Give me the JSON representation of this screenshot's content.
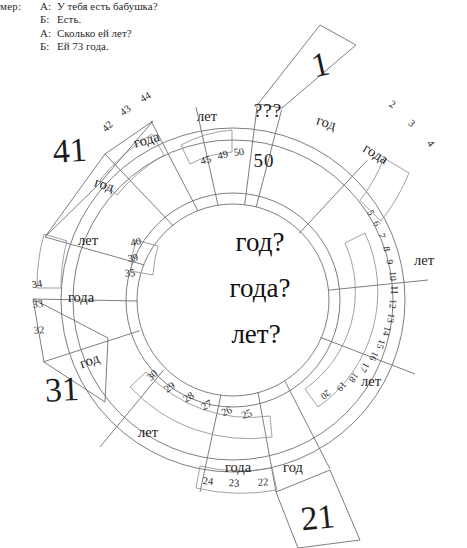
{
  "dialogue": {
    "lead_in": "имер:",
    "lines": [
      {
        "speaker": "А:",
        "text": "У тебя есть бабушка?"
      },
      {
        "speaker": "Б:",
        "text": "Есть."
      },
      {
        "speaker": "А:",
        "text": "Сколько ей лет?"
      },
      {
        "speaker": "Б:",
        "text": "Ей 73 года."
      }
    ]
  },
  "wheel": {
    "center": {
      "line1": "год?",
      "line2": "года?",
      "line3": "лет?"
    },
    "inner_ring": [
      {
        "id": "inner-god-1",
        "label": "год"
      },
      {
        "id": "inner-goda-1",
        "label": "года"
      },
      {
        "id": "inner-let-1",
        "label": "лет"
      },
      {
        "id": "inner-let-2",
        "label": "лет"
      },
      {
        "id": "inner-god-2",
        "label": "год"
      },
      {
        "id": "inner-goda-2",
        "label": "года"
      },
      {
        "id": "inner-let-3",
        "label": "лет"
      },
      {
        "id": "inner-god-3",
        "label": "год"
      },
      {
        "id": "inner-goda-3",
        "label": "года"
      },
      {
        "id": "inner-let-4",
        "label": "лет"
      },
      {
        "id": "inner-god-4",
        "label": "год"
      },
      {
        "id": "inner-goda-4",
        "label": "года"
      },
      {
        "id": "inner-let-5",
        "label": "лет"
      },
      {
        "id": "inner-unknown-1",
        "label": "???"
      }
    ],
    "outer_numbers": [
      {
        "id": "num-1",
        "label": "1",
        "size": "big"
      },
      {
        "id": "num-2",
        "label": "2",
        "size": "small"
      },
      {
        "id": "num-3",
        "label": "3",
        "size": "small"
      },
      {
        "id": "num-4",
        "label": "4",
        "size": "small"
      },
      {
        "id": "num-5",
        "label": "5",
        "size": "tiny"
      },
      {
        "id": "num-6",
        "label": "6",
        "size": "tiny"
      },
      {
        "id": "num-7",
        "label": "7",
        "size": "tiny"
      },
      {
        "id": "num-8",
        "label": "8",
        "size": "tiny"
      },
      {
        "id": "num-9",
        "label": "9",
        "size": "tiny"
      },
      {
        "id": "num-10",
        "label": "10",
        "size": "tiny"
      },
      {
        "id": "num-11",
        "label": "11",
        "size": "tiny"
      },
      {
        "id": "num-12",
        "label": "12",
        "size": "tiny"
      },
      {
        "id": "num-13",
        "label": "13",
        "size": "tiny"
      },
      {
        "id": "num-14",
        "label": "14",
        "size": "tiny"
      },
      {
        "id": "num-15",
        "label": "15",
        "size": "tiny"
      },
      {
        "id": "num-16",
        "label": "16",
        "size": "tiny"
      },
      {
        "id": "num-17",
        "label": "17",
        "size": "tiny"
      },
      {
        "id": "num-18",
        "label": "18",
        "size": "tiny"
      },
      {
        "id": "num-19",
        "label": "19",
        "size": "tiny"
      },
      {
        "id": "num-20",
        "label": "20",
        "size": "tiny"
      },
      {
        "id": "num-21",
        "label": "21",
        "size": "big"
      },
      {
        "id": "num-22",
        "label": "22",
        "size": "small"
      },
      {
        "id": "num-23",
        "label": "23",
        "size": "small"
      },
      {
        "id": "num-24",
        "label": "24",
        "size": "small"
      },
      {
        "id": "num-25",
        "label": "25",
        "size": "small"
      },
      {
        "id": "num-26",
        "label": "26",
        "size": "small"
      },
      {
        "id": "num-27",
        "label": "27",
        "size": "small"
      },
      {
        "id": "num-28",
        "label": "28",
        "size": "small"
      },
      {
        "id": "num-29",
        "label": "29",
        "size": "small"
      },
      {
        "id": "num-30",
        "label": "30",
        "size": "small"
      },
      {
        "id": "num-31",
        "label": "31",
        "size": "big"
      },
      {
        "id": "num-32",
        "label": "32",
        "size": "small"
      },
      {
        "id": "num-33",
        "label": "33",
        "size": "small"
      },
      {
        "id": "num-34",
        "label": "34",
        "size": "small"
      },
      {
        "id": "num-35",
        "label": "35",
        "size": "small"
      },
      {
        "id": "num-39",
        "label": "39",
        "size": "small"
      },
      {
        "id": "num-40",
        "label": "40",
        "size": "small"
      },
      {
        "id": "num-41",
        "label": "41",
        "size": "big"
      },
      {
        "id": "num-42",
        "label": "42",
        "size": "small"
      },
      {
        "id": "num-43",
        "label": "43",
        "size": "small"
      },
      {
        "id": "num-44",
        "label": "44",
        "size": "small"
      },
      {
        "id": "num-45",
        "label": "45",
        "size": "small"
      },
      {
        "id": "num-49",
        "label": "49",
        "size": "small"
      },
      {
        "id": "num-50",
        "label": "50",
        "size": "small"
      },
      {
        "id": "num-unknown",
        "label": "???",
        "size": "qmark"
      }
    ]
  }
}
